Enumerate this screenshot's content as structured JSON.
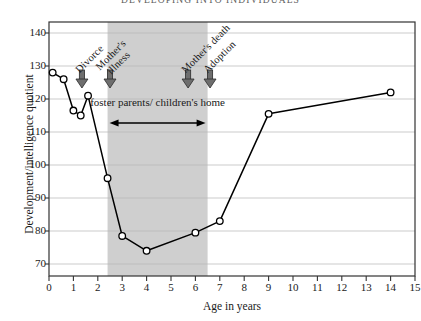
{
  "running_head": "DEVELOPING INTO INDIVIDUALS",
  "chart_data": {
    "type": "line",
    "title": "",
    "xlabel": "Age in years",
    "ylabel": "Development/intelligence quotient",
    "xlim": [
      0,
      15
    ],
    "ylim": [
      70,
      140
    ],
    "xticks": [
      0,
      1,
      2,
      3,
      4,
      5,
      6,
      7,
      8,
      9,
      10,
      11,
      12,
      13,
      14,
      15
    ],
    "yticks": [
      70,
      80,
      90,
      100,
      110,
      120,
      130,
      140
    ],
    "grid": "horizontal",
    "legend": "none",
    "marker": "open-circle",
    "line_color": "#000000",
    "series": [
      {
        "name": "Development/intelligence quotient",
        "points": [
          {
            "x": 0.15,
            "y": 128
          },
          {
            "x": 0.6,
            "y": 126
          },
          {
            "x": 1.0,
            "y": 116.5
          },
          {
            "x": 1.3,
            "y": 115
          },
          {
            "x": 1.6,
            "y": 121
          },
          {
            "x": 2.4,
            "y": 96
          },
          {
            "x": 3.0,
            "y": 78.5
          },
          {
            "x": 4.0,
            "y": 74
          },
          {
            "x": 6.0,
            "y": 79.5
          },
          {
            "x": 7.0,
            "y": 83
          },
          {
            "x": 9.0,
            "y": 115.5
          },
          {
            "x": 14.0,
            "y": 122
          }
        ]
      }
    ],
    "shaded_band": {
      "x_start": 2.4,
      "x_end": 6.5,
      "color": "#cfcfcf",
      "label_line1": "foster parents/",
      "label_line2": "children's home"
    },
    "annotations": [
      {
        "text": "Divorce",
        "x": 1.35,
        "arrow": "down"
      },
      {
        "text": "Mother's",
        "text2": "illness",
        "x": 2.5,
        "arrow": "down"
      },
      {
        "text": "Mother's death",
        "x": 5.7,
        "arrow": "down"
      },
      {
        "text": "Adoption",
        "x": 6.6,
        "arrow": "down"
      }
    ]
  }
}
